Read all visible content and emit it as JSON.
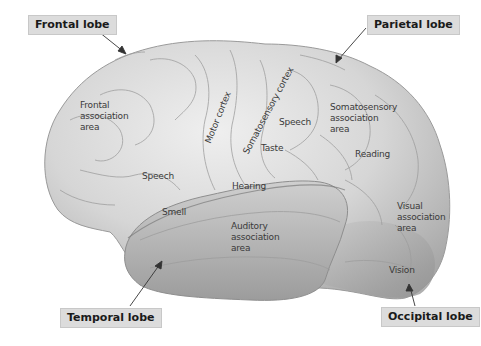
{
  "diagram": {
    "lobes": [
      {
        "id": "frontal",
        "label": "Frontal lobe"
      },
      {
        "id": "parietal",
        "label": "Parietal lobe"
      },
      {
        "id": "temporal",
        "label": "Temporal lobe"
      },
      {
        "id": "occipital",
        "label": "Occipital lobe"
      }
    ],
    "regions": [
      {
        "id": "frontal-association",
        "label": "Frontal\nassociation\narea"
      },
      {
        "id": "motor-cortex",
        "label": "Motor cortex"
      },
      {
        "id": "somatosensory-cortex",
        "label": "Somatosensory cortex"
      },
      {
        "id": "speech-parietal",
        "label": "Speech"
      },
      {
        "id": "somatosensory-association",
        "label": "Somatosensory\nassociation\narea"
      },
      {
        "id": "taste",
        "label": "Taste"
      },
      {
        "id": "reading",
        "label": "Reading"
      },
      {
        "id": "speech-frontal",
        "label": "Speech"
      },
      {
        "id": "hearing",
        "label": "Hearing"
      },
      {
        "id": "smell",
        "label": "Smell"
      },
      {
        "id": "auditory-association",
        "label": "Auditory\nassociation\narea"
      },
      {
        "id": "visual-association",
        "label": "Visual\nassociation\narea"
      },
      {
        "id": "vision",
        "label": "Vision"
      }
    ],
    "colors": {
      "label_box_bg": "#dcdcdc",
      "brain_light": "#e6e6e6",
      "brain_mid": "#c4c4c4",
      "brain_dark": "#9a9a9a",
      "text": "#3a3a3a"
    }
  }
}
